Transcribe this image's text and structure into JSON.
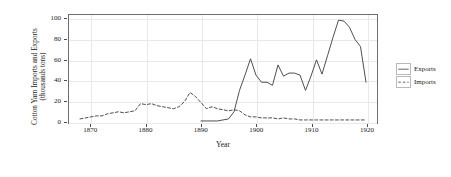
{
  "chart_data": {
    "type": "line",
    "title": "",
    "xlabel": "Year",
    "ylabel_line1": "Cotton Yarn Imports and Exports",
    "ylabel_line2": "(thousands tons)",
    "xlim": [
      1866,
      1922
    ],
    "ylim": [
      -2,
      104
    ],
    "xticks": [
      1870,
      1880,
      1890,
      1900,
      1910,
      1920
    ],
    "yticks": [
      0,
      20,
      40,
      60,
      80,
      100
    ],
    "grid": true,
    "legend_position": "right",
    "series": [
      {
        "name": "Exports",
        "style": "solid",
        "color": "#3a3a3a",
        "x": [
          1890,
          1891,
          1892,
          1893,
          1894,
          1895,
          1896,
          1897,
          1898,
          1899,
          1900,
          1901,
          1902,
          1903,
          1904,
          1905,
          1906,
          1907,
          1908,
          1909,
          1910,
          1911,
          1912,
          1913,
          1914,
          1915,
          1916,
          1917,
          1918,
          1919,
          1920
        ],
        "values": [
          0,
          0,
          0,
          0,
          1,
          2,
          9,
          30,
          45,
          61,
          45,
          38,
          38,
          35,
          55,
          44,
          47,
          47,
          45,
          30,
          44,
          60,
          46,
          64,
          82,
          99,
          98,
          92,
          80,
          73,
          38
        ]
      },
      {
        "name": "Imports",
        "style": "dashed",
        "color": "#3a3a3a",
        "x": [
          1868,
          1869,
          1870,
          1871,
          1872,
          1873,
          1874,
          1875,
          1876,
          1877,
          1878,
          1879,
          1880,
          1881,
          1882,
          1883,
          1884,
          1885,
          1886,
          1887,
          1888,
          1889,
          1890,
          1891,
          1892,
          1893,
          1894,
          1895,
          1896,
          1897,
          1898,
          1899,
          1900,
          1901,
          1902,
          1903,
          1904,
          1905,
          1906,
          1907,
          1908,
          1909,
          1910,
          1911,
          1912,
          1913,
          1914,
          1915,
          1916,
          1917,
          1918,
          1919,
          1920
        ],
        "values": [
          2,
          3,
          4,
          5,
          5,
          7,
          8,
          9,
          8,
          9,
          10,
          17,
          16,
          17,
          15,
          14,
          13,
          12,
          14,
          19,
          28,
          24,
          18,
          12,
          14,
          12,
          11,
          10,
          11,
          10,
          6,
          4,
          4,
          3,
          3,
          3,
          2,
          3,
          2,
          2,
          1,
          1,
          1,
          1,
          1,
          1,
          1,
          1,
          1,
          1,
          1,
          1,
          1
        ]
      }
    ],
    "legend": [
      {
        "label": "Exports",
        "style": "solid"
      },
      {
        "label": "Imports",
        "style": "dashed"
      }
    ]
  }
}
